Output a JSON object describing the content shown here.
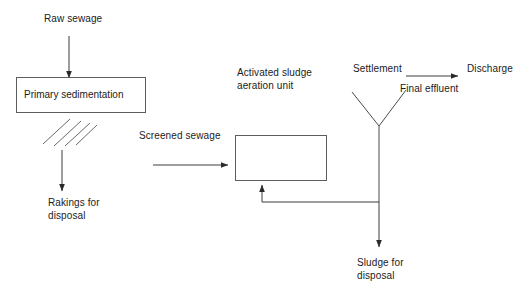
{
  "diagram": {
    "background_color": "#ffffff",
    "line_color": "#3d3d3d",
    "box_border_color": "#5d5d5d",
    "text_color": "#1b1b1b",
    "units": [
      {
        "id": "primary-sedimentation",
        "label": "Primary sedimentation",
        "x": 16,
        "y": 77,
        "width": 130,
        "height": 36
      },
      {
        "id": "aeration-unit",
        "label": "",
        "x": 235,
        "y": 135,
        "width": 92,
        "height": 46
      }
    ],
    "labels": {
      "raw_sewage": "Raw sewage",
      "primary_sedimentation": "Primary sedimentation",
      "rakings_for_disposal_line1": "Rakings for",
      "rakings_for_disposal_line2": "disposal",
      "screened_sewage": "Screened sewage",
      "activated_sludge_line1": "Activated sludge",
      "activated_sludge_line2": "aeration unit",
      "settlement": "Settlement",
      "final_effluent": "Final effluent",
      "discharge": "Discharge",
      "sludge_for_disposal_line1": "Sludge for",
      "sludge_for_disposal_line2": "disposal"
    },
    "flows": [
      {
        "id": "raw-sewage-arrow",
        "from": "Raw sewage",
        "to": "Primary sedimentation",
        "direction": "down"
      },
      {
        "id": "rakings-arrow",
        "from": "Screen",
        "to": "Rakings for disposal",
        "direction": "down"
      },
      {
        "id": "screened-sewage-arrow",
        "from": "Screen",
        "to": "Activated sludge aeration unit",
        "direction": "right"
      },
      {
        "id": "final-effluent-arrow",
        "from": "Settlement",
        "to": "Discharge",
        "direction": "right"
      },
      {
        "id": "sludge-disposal-arrow",
        "from": "Settlement",
        "to": "Sludge for disposal",
        "direction": "down"
      },
      {
        "id": "return-sludge-arrow",
        "from": "Settlement",
        "to": "Activated sludge aeration unit",
        "direction": "left-up"
      }
    ]
  }
}
